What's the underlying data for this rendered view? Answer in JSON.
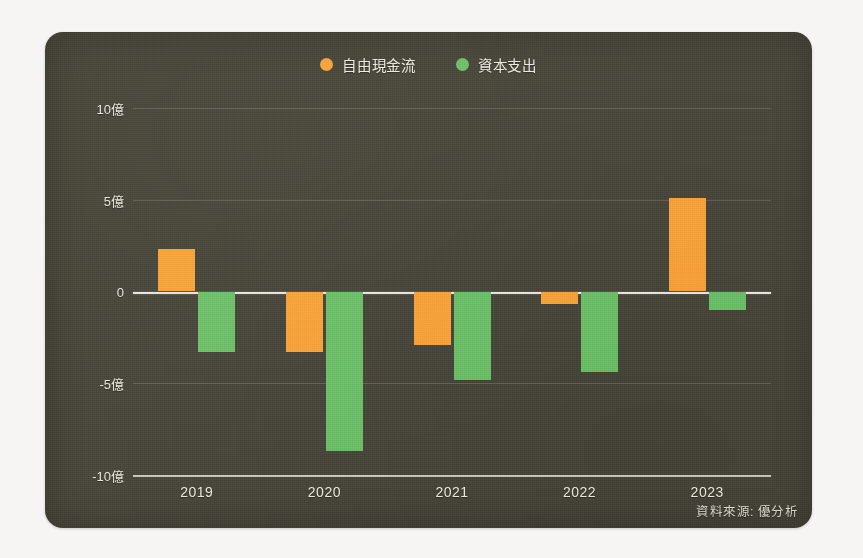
{
  "card": {
    "background_color": "#4a483c",
    "page_background_color": "#f6f5f3"
  },
  "legend": {
    "position": "top-center",
    "items": [
      {
        "label": "自由現金流",
        "color": "#f5a33c",
        "marker": "legend-dot-orange"
      },
      {
        "label": "資本支出",
        "color": "#6fbf6a",
        "marker": "legend-dot-green"
      }
    ]
  },
  "axes": {
    "y_ticks": [
      "10億",
      "5億",
      "0",
      "-5億",
      "-10億"
    ],
    "y_tick_values": [
      10,
      5,
      0,
      -5,
      -10
    ],
    "x_ticks": [
      "2019",
      "2020",
      "2021",
      "2022",
      "2023"
    ]
  },
  "source": {
    "text": "資料來源: 優分析"
  },
  "chart_data": {
    "type": "bar",
    "title": "",
    "subtitle": "",
    "xlabel": "",
    "ylabel": "",
    "unit": "億",
    "categories": [
      "2019",
      "2020",
      "2021",
      "2022",
      "2023"
    ],
    "series": [
      {
        "name": "自由現金流",
        "color": "#f5a33c",
        "values": [
          2.3,
          -3.3,
          -2.9,
          -0.7,
          5.1
        ]
      },
      {
        "name": "資本支出",
        "color": "#6fbf6a",
        "values": [
          -3.3,
          -8.7,
          -4.8,
          -4.4,
          -1.0
        ]
      }
    ],
    "ylim": [
      -10,
      10
    ],
    "y_ticks": [
      10,
      5,
      0,
      -5,
      -10
    ],
    "grid": true,
    "zero_line": true,
    "legend_position": "top-center",
    "annotations": [
      "資料來源: 優分析"
    ]
  }
}
